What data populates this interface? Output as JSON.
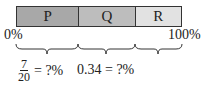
{
  "bar": {
    "segments": [
      {
        "label": "P",
        "color": "#a8a8a8",
        "width": 62
      },
      {
        "label": "Q",
        "color": "#bdbdbd",
        "width": 57
      },
      {
        "label": "R",
        "color": "#e2e2e2",
        "width": 47
      }
    ],
    "start_label": "0%",
    "end_label": "100%"
  },
  "expressions": {
    "p": {
      "numerator": "7",
      "denominator": "20",
      "rest": "= ?%"
    },
    "q": {
      "text": "0.34 = ?%"
    }
  }
}
